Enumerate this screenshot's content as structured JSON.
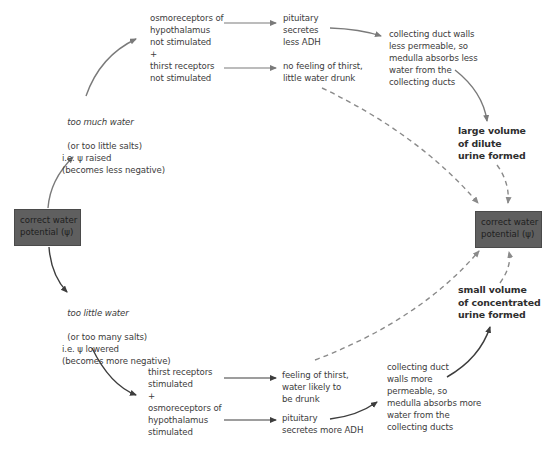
{
  "boxes": {
    "left": {
      "label": "correct water\npotential (ψ)"
    },
    "right": {
      "label": "correct water\npotential (ψ)"
    }
  },
  "upper_path": {
    "trigger": {
      "title": "too much water",
      "lines": "(or too little salts)\ni.e. ψ raised\n(becomes less negative)"
    },
    "receptors": "osmoreceptors of\nhypothalamus\nnot stimulated\n+\nthirst receptors\nnot stimulated",
    "pituitary": "pituitary\nsecretes\nless ADH",
    "thirst": "no feeling of thirst,\nlittle water drunk",
    "collecting_duct": "collecting duct walls\nless permeable, so\nmedulla absorbs less\nwater from the\ncollecting ducts",
    "outcome": "large volume\nof dilute\nurine formed"
  },
  "lower_path": {
    "trigger": {
      "title": "too little water",
      "lines": "(or too many salts)\ni.e. ψ lowered\n(becomes more negative)"
    },
    "receptors": "thirst receptors\nstimulated\n+\nosmoreceptors of\nhypothalamus\nstimulated",
    "thirst": "feeling of thirst,\nwater likely to\nbe drunk",
    "pituitary": "pituitary\nsecretes more ADH",
    "collecting_duct": "collecting duct\nwalls more\npermeable, so\nmedulla absorbs more\nwater from the\ncollecting ducts",
    "outcome": "small volume\nof concentrated\nurine formed"
  },
  "colors": {
    "box_fill": "#5f5f5f",
    "upper_arrow": "#7a7a7a",
    "lower_arrow": "#3d3d3d",
    "dashed_arrow": "#8a8a8a",
    "text": "#3c3c3c"
  }
}
